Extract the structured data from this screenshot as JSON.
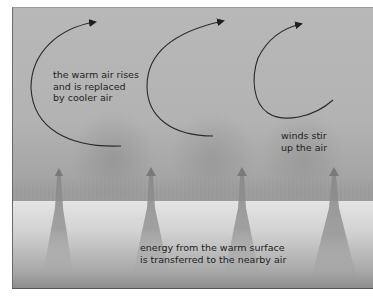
{
  "diagram": {
    "labels": {
      "rising_air": [
        "the warm air rises",
        "and is replaced",
        "by cooler air"
      ],
      "winds": [
        "winds stir",
        "up the air"
      ],
      "energy": [
        "energy from the warm surface",
        "is transferred to the nearby air"
      ]
    },
    "elements": {
      "curved_arrows": 3,
      "upward_arrows": 4,
      "surface": "warm ground with grass"
    },
    "colors": {
      "sky": "#b5b5b5",
      "ground": "#dedede",
      "arrow_line": "#2a2a2a",
      "text": "#1e1e1e"
    }
  }
}
